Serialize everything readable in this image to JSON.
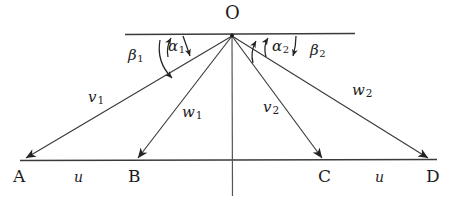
{
  "figure": {
    "type": "geometry-diagram",
    "stroke_color": "#2b2b2b",
    "text_color": "#1c1c1c",
    "background": "#ffffff"
  },
  "apex": {
    "label": "O",
    "x": 232,
    "y": 35
  },
  "baseline": {
    "y": 160,
    "x_start": 20,
    "x_end": 437,
    "points": [
      {
        "name": "point-a",
        "label": "A",
        "x": 22
      },
      {
        "name": "point-b",
        "label": "B",
        "x": 135
      },
      {
        "name": "point-c",
        "label": "C",
        "x": 325
      },
      {
        "name": "point-d",
        "label": "D",
        "x": 432
      }
    ],
    "segments": [
      {
        "name": "segment-ab",
        "label": "u",
        "x": 78
      },
      {
        "name": "segment-cd",
        "label": "u",
        "x": 378
      }
    ]
  },
  "top_line": {
    "x_start": 125,
    "x_end": 355,
    "y": 34
  },
  "vertical_axis": {
    "x": 232,
    "y_start": 35,
    "y_end": 196
  },
  "rays": [
    {
      "name": "ray-oa",
      "label": "v",
      "sub": "1",
      "label_x": 76,
      "label_y": 98,
      "to": "A"
    },
    {
      "name": "ray-ob",
      "label": "w",
      "sub": "1",
      "label_x": 178,
      "label_y": 112,
      "to": "B"
    },
    {
      "name": "ray-oc",
      "label": "v",
      "sub": "2",
      "label_x": 258,
      "label_y": 105,
      "to": "C"
    },
    {
      "name": "ray-od",
      "label": "w",
      "sub": "2",
      "label_x": 354,
      "label_y": 88,
      "to": "D"
    }
  ],
  "angles": [
    {
      "name": "angle-beta-1",
      "label": "β",
      "sub": "1",
      "label_x": 128,
      "label_y": 52
    },
    {
      "name": "angle-alpha-1",
      "label": "α",
      "sub": "1",
      "label_x": 168,
      "label_y": 44
    },
    {
      "name": "angle-alpha-2",
      "label": "α",
      "sub": "2",
      "label_x": 272,
      "label_y": 44
    },
    {
      "name": "angle-beta-2",
      "label": "β",
      "sub": "2",
      "label_x": 312,
      "label_y": 48
    }
  ]
}
